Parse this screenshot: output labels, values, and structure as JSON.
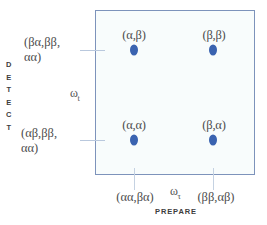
{
  "figure": {
    "type": "2d-correlation-spectrum",
    "background_color": "#ffffff",
    "plot_fill_color": "#f8fcfc",
    "plot_border_color": "#7d93bb",
    "peak_color": "#3a63b0",
    "axes": {
      "vertical": {
        "title": "DETECT",
        "letters": [
          "D",
          "E",
          "T",
          "E",
          "C",
          "T"
        ],
        "frequency_symbol": "ω",
        "frequency_subscript": "t",
        "tick_labels": [
          {
            "line1": "(βα,ββ,",
            "line2": "αα)"
          },
          {
            "line1": "(αβ,ββ,",
            "line2": "αα)"
          }
        ]
      },
      "horizontal": {
        "title": "PREPARE",
        "frequency_symbol": "ω",
        "frequency_subscript": "τ",
        "tick_labels": [
          "(αα,βα)",
          "(ββ,αβ)"
        ]
      }
    },
    "peaks": [
      {
        "label": "(α,β)",
        "x": 134,
        "y": 50
      },
      {
        "label": "(β,β)",
        "x": 213,
        "y": 50
      },
      {
        "label": "(α,α)",
        "x": 134,
        "y": 140
      },
      {
        "label": "(β,α)",
        "x": 213,
        "y": 140
      }
    ]
  }
}
